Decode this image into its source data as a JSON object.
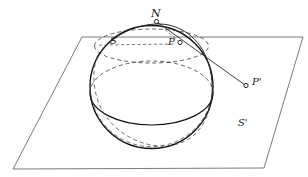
{
  "figure": {
    "background_color": "#ffffff",
    "stroke_color": "#1a1a1a",
    "plane_stroke_color": "#555555",
    "dash_stroke_color": "#4a4a4a",
    "width": 308,
    "height": 177
  },
  "labels": {
    "north_pole": "N",
    "sphere": "S",
    "point_on_sphere": "P",
    "projected_point": "P'",
    "plane": "S'"
  },
  "geometry": {
    "plane": {
      "corners": [
        [
          82,
          37
        ],
        [
          303,
          37
        ],
        [
          264,
          168
        ],
        [
          13,
          169
        ]
      ]
    },
    "sphere": {
      "center": [
        151.5,
        87
      ],
      "radius": 61.5
    },
    "equator_ellipse": {
      "center": [
        151.5,
        93
      ],
      "rx": 61.5,
      "ry": 32
    },
    "horizon_ellipse": {
      "center": [
        151.5,
        46
      ],
      "rx": 57,
      "ry": 17
    },
    "points": {
      "N": [
        156,
        21
      ],
      "P": [
        180,
        43
      ],
      "P_prime": [
        246,
        86
      ]
    }
  }
}
